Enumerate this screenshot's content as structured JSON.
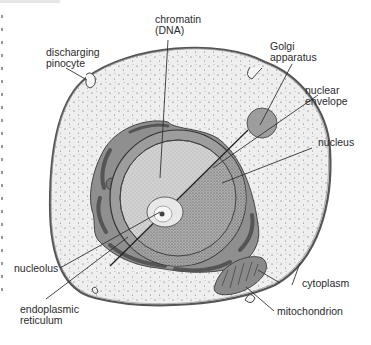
{
  "diagram": {
    "colors": {
      "cytoplasm_fill": "#eeeeee",
      "membrane": "#555555",
      "er_fill": "#8c8c8c",
      "nucleus_fill": "#cfcfcf",
      "nucleus_dark": "#9a9a9a",
      "golgi_fill": "#9d9d9d",
      "mito_fill": "#8a8a8a",
      "leader_line": "#333333",
      "text": "#2b2b2b"
    },
    "labels": {
      "chromatin": "chromatin\n(DNA)",
      "discharging_pinocyte": "discharging\npinocyte",
      "golgi": "Golgi\napparatus",
      "nuclear_envelope": "nuclear\nenvelope",
      "nucleus": "nucleus",
      "nucleolus": "nucleolus",
      "endoplasmic_reticulum": "endoplasmic\nreticulum",
      "cytoplasm": "cytoplasm",
      "mitochondrion": "mitochondrion"
    }
  }
}
